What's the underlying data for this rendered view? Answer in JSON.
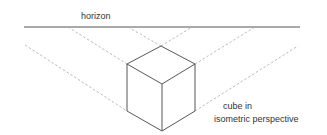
{
  "labels": {
    "horizon": "horizon",
    "caption_line1": "cube in",
    "caption_line2": "isometric perspective"
  },
  "colors": {
    "background": "#ffffff",
    "cube_stroke": "#444444",
    "horizon_stroke": "#555555",
    "guide_stroke": "#aaaaaa",
    "text": "#333333"
  }
}
